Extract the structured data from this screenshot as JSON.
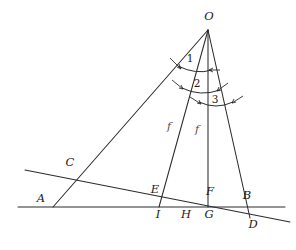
{
  "figure": {
    "background_color": "#ffffff",
    "stroke_color": "#2b2b2b",
    "label_color": "#1a1a1a",
    "f_label_color": "#4d4d4d",
    "width": 296,
    "height": 250
  },
  "points": [
    {
      "id": "O",
      "label": "O",
      "x": 208,
      "y": 30,
      "label_x": 209,
      "label_y": 17
    },
    {
      "id": "A",
      "label": "A",
      "x": 53,
      "y": 207,
      "label_x": 41,
      "label_y": 199
    },
    {
      "id": "B",
      "label": "B",
      "x": 247,
      "y": 207,
      "label_x": 247,
      "label_y": 196
    },
    {
      "id": "C",
      "label": "C",
      "x": 73,
      "y": 174,
      "label_x": 70,
      "label_y": 163
    },
    {
      "id": "D",
      "label": "D",
      "x": 250,
      "y": 217,
      "label_x": 253,
      "label_y": 225
    },
    {
      "id": "E",
      "label": "E",
      "x": 163,
      "y": 199,
      "label_x": 155,
      "label_y": 190
    },
    {
      "id": "F",
      "label": "F",
      "x": 208,
      "y": 207,
      "label_x": 210,
      "label_y": 192
    },
    {
      "id": "G",
      "label": "G",
      "x": 208,
      "y": 207,
      "label_x": 209,
      "label_y": 215
    },
    {
      "id": "H",
      "label": "H",
      "x": 185,
      "y": 207,
      "label_x": 186,
      "label_y": 215
    },
    {
      "id": "I",
      "label": "I",
      "x": 159,
      "y": 207,
      "label_x": 158,
      "label_y": 215
    }
  ],
  "angle_labels": [
    {
      "id": "angle-1",
      "label": "1",
      "x": 190,
      "y": 58
    },
    {
      "id": "angle-2",
      "label": "2",
      "x": 197,
      "y": 83
    },
    {
      "id": "angle-3",
      "label": "3",
      "x": 215,
      "y": 99
    }
  ],
  "segment_labels": [
    {
      "id": "f-left",
      "label": "f",
      "x": 169,
      "y": 126
    },
    {
      "id": "f-right",
      "label": "f",
      "x": 197,
      "y": 129
    }
  ],
  "lines": [
    {
      "id": "ray-O-A",
      "x1": 208,
      "y1": 30,
      "x2": 53,
      "y2": 207
    },
    {
      "id": "ray-O-I",
      "x1": 208,
      "y1": 30,
      "x2": 159,
      "y2": 207
    },
    {
      "id": "ray-O-G",
      "x1": 208,
      "y1": 30,
      "x2": 208,
      "y2": 207
    },
    {
      "id": "ray-O-D",
      "x1": 208,
      "y1": 30,
      "x2": 250,
      "y2": 218
    },
    {
      "id": "baseline-horizontal",
      "x1": 18,
      "y1": 207,
      "x2": 285,
      "y2": 207
    },
    {
      "id": "transversal-slanted",
      "x1": 25,
      "y1": 170,
      "x2": 290,
      "y2": 222
    }
  ]
}
